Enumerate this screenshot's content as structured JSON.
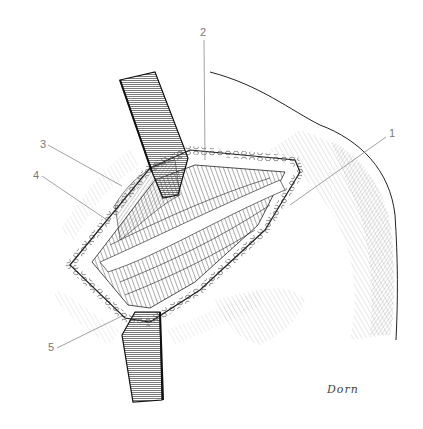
{
  "figure": {
    "type": "anatomical surgical illustration",
    "style": "pen-and-ink stipple/hatching, grayscale",
    "background": "#ffffff",
    "ink": "#1a1a1a",
    "leader_line_color": "#8a8a8a"
  },
  "labels": [
    {
      "id": "1",
      "text": "1",
      "x": 389,
      "y": 128,
      "line": [
        386,
        137,
        290,
        205
      ]
    },
    {
      "id": "2",
      "text": "2",
      "x": 200,
      "y": 27,
      "line": [
        204,
        40,
        205,
        160
      ]
    },
    {
      "id": "3",
      "text": "3",
      "x": 40,
      "y": 139,
      "line": [
        48,
        145,
        122,
        186
      ]
    },
    {
      "id": "4",
      "text": "4",
      "x": 33,
      "y": 170,
      "line": [
        42,
        176,
        110,
        222
      ]
    },
    {
      "id": "5",
      "text": "5",
      "x": 48,
      "y": 342,
      "line": [
        57,
        348,
        122,
        316
      ]
    }
  ],
  "signature": {
    "text": "Dorn",
    "x": 327,
    "y": 383
  },
  "elements": {
    "upper_retractor": "retractor blade (upper)",
    "lower_retractor": "retractor blade (lower)",
    "incision": "open surgical incision with exposed muscle",
    "shoulder": "shoulder outline with hatching"
  }
}
